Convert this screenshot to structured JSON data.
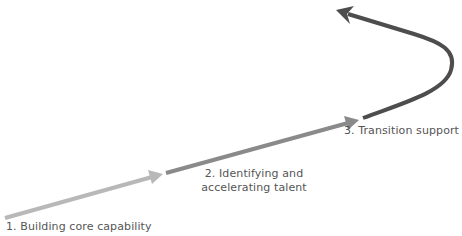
{
  "diagram": {
    "type": "progression-arrow",
    "stages": [
      {
        "id": 1,
        "label": "1. Building core capability",
        "color": "#b8b8b8",
        "path": "M 5 218 L 152 177",
        "arrowhead": "M 148 170 L 163 174 L 152 184 Z"
      },
      {
        "id": 2,
        "label_line1": "2. Identifying and",
        "label_line2": "accelerating talent",
        "color": "#8a8a8a",
        "path": "M 166 173 L 348 123",
        "arrowhead": "M 344 116 L 359 120 L 348 130 Z"
      },
      {
        "id": 3,
        "label": "3. Transition support",
        "color": "#4d4d4d",
        "path": "M 363 118 C 400 104, 445 92, 451 70 C 457 50, 440 42, 414 34 L 348 14",
        "arrowhead": "M 336 10 L 354 6 L 347 14 L 350 24 Z"
      }
    ]
  }
}
